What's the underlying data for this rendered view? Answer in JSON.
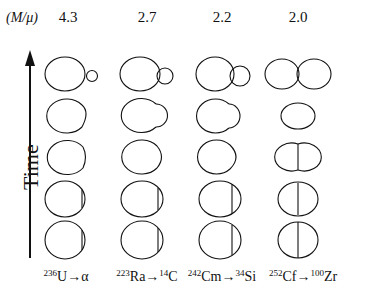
{
  "header": {
    "label": "(M/μ)"
  },
  "axis": {
    "label": "Time",
    "arrow": "up"
  },
  "columns": [
    {
      "ratio": "4.3",
      "reaction": {
        "parent_mass": "236",
        "parent": "U",
        "arrow": "→",
        "fragment_mass": "",
        "fragment": "α"
      }
    },
    {
      "ratio": "2.7",
      "reaction": {
        "parent_mass": "223",
        "parent": "Ra",
        "arrow": "→",
        "fragment_mass": "14",
        "fragment": "C"
      }
    },
    {
      "ratio": "2.2",
      "reaction": {
        "parent_mass": "242",
        "parent": "Cm",
        "arrow": "→",
        "fragment_mass": "34",
        "fragment": "Si"
      }
    },
    {
      "ratio": "2.0",
      "reaction": {
        "parent_mass": "252",
        "parent": "Cf",
        "arrow": "→",
        "fragment_mass": "100",
        "fragment": "Zr"
      }
    }
  ],
  "layout": {
    "column_x": [
      68,
      147,
      222,
      298
    ],
    "row_y": [
      74,
      116,
      157,
      198,
      240
    ],
    "stroke_color": "#111111"
  }
}
